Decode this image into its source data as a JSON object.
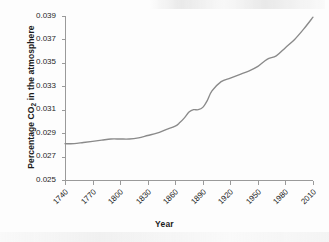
{
  "chart_data": {
    "type": "line",
    "title": "",
    "xlabel": "Year",
    "ylabel_html": "Percentage CO<sub>2</sub> in the atmosphere",
    "ylabel_text": "Percentage CO2 in the atmosphere",
    "xlim": [
      1740,
      2010
    ],
    "ylim": [
      0.025,
      0.039
    ],
    "xticks": [
      1740,
      1770,
      1800,
      1830,
      1860,
      1890,
      1920,
      1950,
      1980,
      2010
    ],
    "xtick_labels": [
      "1740",
      "1770",
      "1800",
      "1830",
      "1860",
      "1890",
      "1920",
      "1950",
      "1980",
      "2010"
    ],
    "yticks": [
      0.025,
      0.027,
      0.029,
      0.031,
      0.033,
      0.035,
      0.037,
      0.039
    ],
    "ytick_labels": [
      "0.025",
      "0.027",
      "0.029",
      "0.031",
      "0.033",
      "0.035",
      "0.037",
      "0.039"
    ],
    "grid": false,
    "legend": false,
    "legend_position": "none",
    "line_color": "#8a8a8a",
    "axis_color": "#9a9a9a",
    "text_color": "#1b1b1b",
    "series": [
      {
        "name": "Percentage CO2 in the atmosphere",
        "x": [
          1740,
          1750,
          1760,
          1770,
          1780,
          1790,
          1800,
          1810,
          1820,
          1830,
          1840,
          1850,
          1860,
          1865,
          1870,
          1875,
          1880,
          1885,
          1890,
          1895,
          1900,
          1910,
          1920,
          1930,
          1940,
          1950,
          1960,
          1970,
          1980,
          1990,
          2000,
          2010
        ],
        "values": [
          0.0281,
          0.0281,
          0.0282,
          0.0283,
          0.0284,
          0.0285,
          0.0285,
          0.0285,
          0.0286,
          0.0288,
          0.029,
          0.0293,
          0.0296,
          0.0299,
          0.0303,
          0.0308,
          0.031,
          0.031,
          0.0312,
          0.0318,
          0.0326,
          0.0334,
          0.0337,
          0.034,
          0.0343,
          0.0347,
          0.0353,
          0.0356,
          0.0363,
          0.037,
          0.0379,
          0.0389
        ]
      }
    ]
  },
  "axes_geometry": {
    "plot_left": 65,
    "plot_right": 313,
    "plot_top": 16,
    "plot_bottom": 180
  }
}
